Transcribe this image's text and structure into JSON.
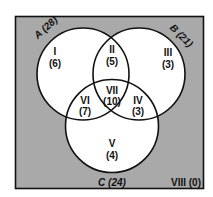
{
  "diagram": {
    "type": "venn-3-set",
    "colors": {
      "universe_fill": "#a9a9a9",
      "circle_fill": "#ffffff",
      "stroke": "#111111"
    },
    "sets": {
      "A": {
        "label": "A (28)",
        "name": "A",
        "total": 28
      },
      "B": {
        "label": "B (21)",
        "name": "B",
        "total": 21
      },
      "C": {
        "label": "C (24)",
        "name": "C",
        "total": 24
      }
    },
    "regions": {
      "I": {
        "numeral": "I",
        "count": "(6)",
        "value": 6,
        "membership": "A only"
      },
      "II": {
        "numeral": "II",
        "count": "(5)",
        "value": 5,
        "membership": "A and B only"
      },
      "III": {
        "numeral": "III",
        "count": "(3)",
        "value": 3,
        "membership": "B only"
      },
      "IV": {
        "numeral": "IV",
        "count": "(3)",
        "value": 3,
        "membership": "B and C only"
      },
      "V": {
        "numeral": "V",
        "count": "(4)",
        "value": 4,
        "membership": "C only"
      },
      "VI": {
        "numeral": "VI",
        "count": "(7)",
        "value": 7,
        "membership": "A and C only"
      },
      "VII": {
        "numeral": "VII",
        "count": "(10)",
        "value": 10,
        "membership": "A, B and C"
      },
      "VIII": {
        "label": "VIII (0)",
        "value": 0,
        "membership": "none"
      }
    }
  }
}
